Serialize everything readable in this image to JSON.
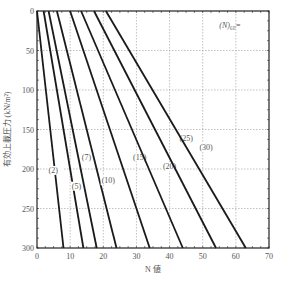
{
  "chart_data": {
    "type": "line",
    "title": "",
    "annotation": "(N)₆₀=",
    "xlabel": "N 値",
    "ylabel": "有効上載圧力 (kN/m²)",
    "xlim": [
      0,
      70
    ],
    "ylim": [
      0,
      300
    ],
    "y_inverted": true,
    "grid": true,
    "x_ticks": [
      "0",
      "10",
      "20",
      "30",
      "40",
      "50",
      "60",
      "70"
    ],
    "y_ticks": [
      "0",
      "50",
      "100",
      "150",
      "200",
      "250",
      "300"
    ],
    "series": [
      {
        "name": "(2)",
        "points": [
          [
            0,
            0
          ],
          [
            8,
            300
          ]
        ],
        "label_pos": [
          3.5,
          205
        ]
      },
      {
        "name": "(5)",
        "points": [
          [
            2,
            0
          ],
          [
            14,
            300
          ]
        ],
        "label_pos": [
          10.5,
          225
        ]
      },
      {
        "name": "(7)",
        "points": [
          [
            3.5,
            0
          ],
          [
            18,
            300
          ]
        ],
        "label_pos": [
          13.5,
          188
        ]
      },
      {
        "name": "(10)",
        "points": [
          [
            6,
            0
          ],
          [
            24,
            300
          ]
        ],
        "label_pos": [
          19.5,
          218
        ]
      },
      {
        "name": "(15)",
        "points": [
          [
            10,
            0
          ],
          [
            34,
            300
          ]
        ],
        "label_pos": [
          29,
          188
        ]
      },
      {
        "name": "(20)",
        "points": [
          [
            13.3,
            0
          ],
          [
            44,
            300
          ]
        ],
        "label_pos": [
          38,
          200
        ]
      },
      {
        "name": "(25)",
        "points": [
          [
            17.2,
            0
          ],
          [
            54,
            300
          ]
        ],
        "label_pos": [
          43,
          164
        ]
      },
      {
        "name": "(30)",
        "points": [
          [
            20.8,
            0
          ],
          [
            63,
            300
          ]
        ],
        "label_pos": [
          49,
          176
        ]
      }
    ]
  }
}
